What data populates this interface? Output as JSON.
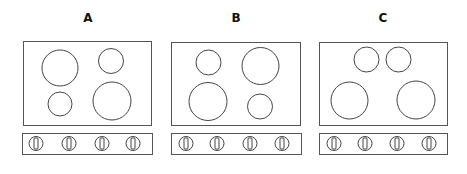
{
  "figure": {
    "stroke_color": "#555555",
    "background": "#ffffff"
  },
  "layouts": [
    {
      "label": "A",
      "label_pos": [
        88,
        22
      ],
      "cooktop": {
        "x": 23,
        "y": 41,
        "w": 128,
        "h": 84
      },
      "burners": [
        {
          "position": "top-left",
          "size": "large",
          "cx": 60,
          "cy": 68,
          "r": 18
        },
        {
          "position": "top-right",
          "size": "small",
          "cx": 111,
          "cy": 61,
          "r": 12.5
        },
        {
          "position": "bottom-left",
          "size": "small",
          "cx": 60,
          "cy": 104,
          "r": 12
        },
        {
          "position": "bottom-right",
          "size": "large",
          "cx": 112,
          "cy": 101,
          "r": 19
        }
      ],
      "control_strip": {
        "x": 22,
        "y": 133,
        "w": 130,
        "h": 21
      },
      "knobs": [
        36,
        69,
        102,
        133
      ]
    },
    {
      "label": "B",
      "label_pos": [
        236,
        22
      ],
      "cooktop": {
        "x": 171,
        "y": 42,
        "w": 129,
        "h": 83
      },
      "burners": [
        {
          "position": "top-left",
          "size": "small",
          "cx": 208.5,
          "cy": 62.5,
          "r": 12.5
        },
        {
          "position": "top-right",
          "size": "large",
          "cx": 260.5,
          "cy": 66,
          "r": 18.5
        },
        {
          "position": "bottom-left",
          "size": "large",
          "cx": 208,
          "cy": 101.5,
          "r": 19
        },
        {
          "position": "bottom-right",
          "size": "small",
          "cx": 260,
          "cy": 106.5,
          "r": 12.5
        }
      ],
      "control_strip": {
        "x": 171,
        "y": 133,
        "w": 130,
        "h": 21
      },
      "knobs": [
        186,
        217,
        250,
        282
      ]
    },
    {
      "label": "C",
      "label_pos": [
        383,
        22
      ],
      "cooktop": {
        "x": 319,
        "y": 42,
        "w": 128,
        "h": 83
      },
      "burners": [
        {
          "position": "top-center-left",
          "size": "small",
          "cx": 366.5,
          "cy": 59.5,
          "r": 12.5
        },
        {
          "position": "top-center-right",
          "size": "small",
          "cx": 398.5,
          "cy": 59.5,
          "r": 12.5
        },
        {
          "position": "bottom-left",
          "size": "large",
          "cx": 349.5,
          "cy": 100.5,
          "r": 18.5
        },
        {
          "position": "bottom-right",
          "size": "large",
          "cx": 416,
          "cy": 100,
          "r": 19
        }
      ],
      "control_strip": {
        "x": 319,
        "y": 133,
        "w": 128,
        "h": 21
      },
      "knobs": [
        334,
        365,
        397,
        429
      ]
    }
  ],
  "knob_style": {
    "r": 7,
    "cy": 143.5,
    "slot_w": 4,
    "slot_h": 11
  }
}
